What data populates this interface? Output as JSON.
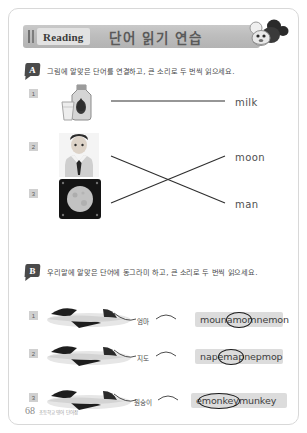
{
  "header": {
    "label_en": "Reading",
    "label_ko": "단어 읽기 연습",
    "mascot_icon": "mouse-mascot-icon"
  },
  "section_a": {
    "marker": "A",
    "instruction": "그림에 알맞은 단어를 연결하고, 큰 소리로 두 번씩 읽으세요.",
    "items": [
      {
        "number": "1",
        "picture": "milk-bottle-icon",
        "word": "milk"
      },
      {
        "number": "2",
        "picture": "man-in-suit-icon",
        "word": "moon"
      },
      {
        "number": "3",
        "picture": "moon-photo-icon",
        "word": "man"
      }
    ]
  },
  "section_b": {
    "marker": "B",
    "instruction": "우리말에 알맞은 단어에 동그라미 하고, 큰 소리로 두 번씩 읽으세요.",
    "items": [
      {
        "number": "1",
        "picture": "airplane-icon",
        "ko": "엄마",
        "prefix": "mouna",
        "answer": "mom",
        "suffix": "nemon"
      },
      {
        "number": "2",
        "picture": "airplane-icon",
        "ko": "지도",
        "prefix": "nape",
        "answer": "map",
        "suffix": "nepmop"
      },
      {
        "number": "3",
        "picture": "airplane-icon",
        "ko": "원숭이",
        "prefix": "e",
        "answer": "monkey",
        "suffix": "munkey"
      }
    ]
  },
  "footer": {
    "page_number": "68",
    "note": "초등학교 영어 단어장"
  },
  "colors": {
    "header_bar": "#bdbdbd",
    "reading_box": "#e2e2e2",
    "marker": "#4a4a4a",
    "chip": "#dcdcdc",
    "page_border": "#d8d8d8"
  }
}
